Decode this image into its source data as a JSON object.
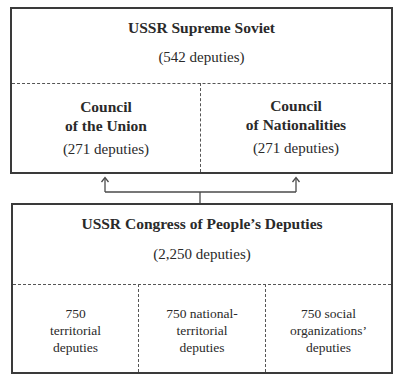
{
  "diagram": {
    "type": "organizational-hierarchy",
    "top_box": {
      "title": "USSR Supreme Soviet",
      "count": "(542 deputies)",
      "chambers": [
        {
          "name_line1": "Council",
          "name_line2": "of the Union",
          "count": "(271 deputies)"
        },
        {
          "name_line1": "Council",
          "name_line2": "of Nationalities",
          "count": "(271 deputies)"
        }
      ]
    },
    "bottom_box": {
      "title": "USSR Congress of People’s Deputies",
      "count": "(2,250 deputies)",
      "groups": [
        {
          "line1": "750",
          "line2": "territorial",
          "line3": "deputies"
        },
        {
          "line1": "750 national-",
          "line2": "territorial",
          "line3": "deputies"
        },
        {
          "line1": "750 social",
          "line2": "organizations’",
          "line3": "deputies"
        }
      ]
    },
    "connector": {
      "from": "USSR Congress of People’s Deputies",
      "to": [
        "Council of the Union",
        "Council of Nationalities"
      ],
      "style": "branching arrows upward"
    },
    "colors": {
      "line": "#3a3a3a",
      "text": "#2a2a2a",
      "background": "#ffffff"
    }
  }
}
